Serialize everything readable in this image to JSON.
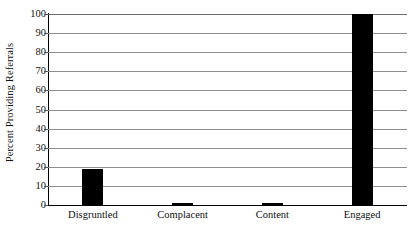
{
  "chart_data": {
    "type": "bar",
    "title": "",
    "subtitle": "",
    "xlabel": "",
    "ylabel": "Percent Providing Referrals",
    "categories": [
      "Disgruntled",
      "Complacent",
      "Content",
      "Engaged"
    ],
    "values": [
      19,
      1,
      1,
      100
    ],
    "series": [
      {
        "name": "Percent Providing Referrals",
        "values": [
          19,
          1,
          1,
          100
        ]
      }
    ],
    "ylim": [
      0,
      100
    ],
    "ytick_labels": [
      "0",
      "10",
      "20",
      "30",
      "40",
      "50",
      "60",
      "70",
      "80",
      "90",
      "100"
    ],
    "ytick_values": [
      0,
      10,
      20,
      30,
      40,
      50,
      60,
      70,
      80,
      90,
      100
    ],
    "grid": true,
    "grid_axis": "y",
    "legend": false,
    "legend_position": "none",
    "bar_color": "#000000",
    "gridline_color": "#8e8e8e",
    "axis_color": "#000000",
    "background_color": "#ffffff"
  }
}
